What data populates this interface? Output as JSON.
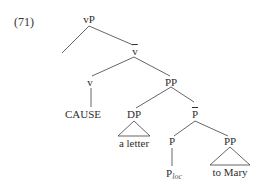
{
  "example_number": "(71)",
  "tree": {
    "nodes": {
      "vP": "vP",
      "v_bar": "v",
      "v": "v",
      "PP_top": "PP",
      "CAUSE": "CAUSE",
      "DP": "DP",
      "a_letter": "a letter",
      "P_bar": "P",
      "P": "P",
      "P_loc_base": "P",
      "P_loc_sub": "loc",
      "PP_low": "PP",
      "to_Mary": "to Mary"
    },
    "bar_nodes": [
      "v_bar",
      "P_bar"
    ],
    "triangle_nodes": [
      "DP",
      "PP_low"
    ],
    "empty_branch": "left daughter of vP"
  },
  "colors": {
    "line": "#555555",
    "text": "#2e2e2e",
    "background": "#ffffff"
  }
}
